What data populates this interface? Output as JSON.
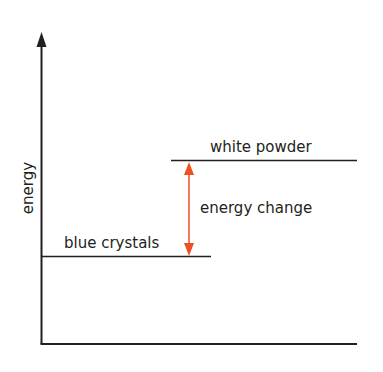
{
  "diagram": {
    "type": "energy-level-diagram",
    "y_axis_label": "energy",
    "levels": [
      {
        "label": "blue crystals",
        "relative_energy": "low"
      },
      {
        "label": "white powder",
        "relative_energy": "high"
      }
    ],
    "arrow_label": "energy change",
    "colors": {
      "axis": "#231f20",
      "level_line": "#231f20",
      "arrow": "#f04e23",
      "background": "#ffffff"
    }
  }
}
